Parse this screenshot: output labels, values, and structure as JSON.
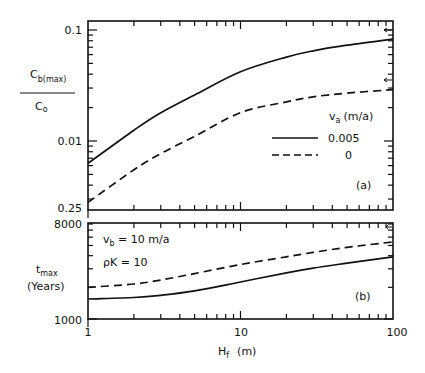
{
  "chart_data": [
    {
      "panel": "(a)",
      "type": "line",
      "title": "",
      "xlabel": "H_f (m)",
      "ylabel": "C_b(max) / C_o",
      "xscale": "log",
      "yscale": "log",
      "xlim": [
        1,
        100
      ],
      "ylim": [
        0.0024,
        0.12
      ],
      "yticks": [
        {
          "value": 0.1,
          "label": "0.1"
        },
        {
          "value": 0.01,
          "label": "0.01"
        },
        {
          "value": 0.0024,
          "label": "0.25"
        }
      ],
      "legend": {
        "title": "v_a (m/a)",
        "position": "right-middle",
        "entries": [
          {
            "label": "0.005",
            "style": "solid"
          },
          {
            "label": "0",
            "style": "dashed"
          }
        ]
      },
      "annotations": [
        {
          "text": "(a)",
          "position": "lower-right"
        },
        {
          "text": "arrow",
          "y": 0.1,
          "side": "right"
        },
        {
          "text": "arrow",
          "y": 0.032,
          "side": "right"
        }
      ],
      "x": [
        1,
        2,
        3,
        5,
        10,
        20,
        30,
        50,
        100
      ],
      "series": [
        {
          "name": "0.005",
          "style": "solid",
          "values": [
            0.0063,
            0.0125,
            0.018,
            0.026,
            0.042,
            0.057,
            0.065,
            0.073,
            0.083
          ]
        },
        {
          "name": "0",
          "style": "dashed",
          "values": [
            0.0028,
            0.0055,
            0.0077,
            0.011,
            0.018,
            0.0225,
            0.025,
            0.027,
            0.029
          ]
        }
      ]
    },
    {
      "panel": "(b)",
      "type": "line",
      "title": "",
      "xlabel": "H_f (m)",
      "ylabel": "t_max (Years)",
      "xscale": "log",
      "yscale": "log",
      "xlim": [
        1,
        100
      ],
      "ylim": [
        1000,
        8000
      ],
      "yticks": [
        {
          "value": 8000,
          "label": "8000"
        },
        {
          "value": 1000,
          "label": "1000"
        }
      ],
      "xticks": [
        {
          "value": 1,
          "label": "1"
        },
        {
          "value": 10,
          "label": "10"
        },
        {
          "value": 100,
          "label": "100"
        }
      ],
      "annotations": [
        {
          "text": "v_b = 10 m/a",
          "position": "upper-left"
        },
        {
          "text": "ρK = 10",
          "position": "upper-left"
        },
        {
          "text": "(b)",
          "position": "lower-right"
        }
      ],
      "x": [
        1,
        2,
        3,
        5,
        10,
        20,
        30,
        50,
        100
      ],
      "series": [
        {
          "name": "0.005",
          "style": "solid",
          "values": [
            1550,
            1600,
            1680,
            1850,
            2250,
            2750,
            3050,
            3400,
            3900
          ]
        },
        {
          "name": "0",
          "style": "dashed",
          "values": [
            2000,
            2150,
            2350,
            2700,
            3300,
            3900,
            4300,
            4800,
            5400
          ]
        }
      ]
    }
  ],
  "labels": {
    "panel_a": {
      "ylabel_top": "C",
      "ylabel_top_sub": "b(max)",
      "ylabel_bottom": "C",
      "ylabel_bottom_sub": "o",
      "ytick_top": "0.1",
      "ytick_mid": "0.01",
      "ytick_bottom": "0.25",
      "legend_title_main": "v",
      "legend_title_sub": "a",
      "legend_title_unit": "(m/a)",
      "legend_solid": "0.005",
      "legend_dashed": "0",
      "panel_tag": "(a)"
    },
    "panel_b": {
      "ylabel_main": "t",
      "ylabel_sub": "max",
      "ylabel_unit": "(Years)",
      "ytick_top": "8000",
      "ytick_bottom": "1000",
      "note1_main": "v",
      "note1_sub": "b",
      "note1_rest": " =  10 m/a",
      "note2": "ρK = 10",
      "panel_tag": "(b)"
    },
    "xaxis": {
      "tick_1": "1",
      "tick_10": "10",
      "tick_100": "100",
      "label_main": "H",
      "label_sub": "f",
      "label_unit": "(m)"
    }
  }
}
